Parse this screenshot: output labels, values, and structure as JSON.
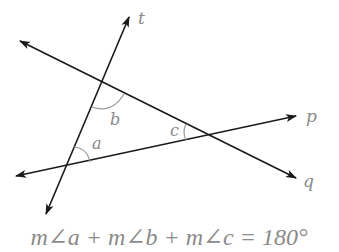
{
  "diagram": {
    "lines": [
      {
        "name": "t",
        "label": "t",
        "from": [
          46,
          214
        ],
        "to": [
          129,
          17
        ]
      },
      {
        "name": "q",
        "label": "q",
        "from": [
          20,
          41
        ],
        "to": [
          296,
          178
        ]
      },
      {
        "name": "p",
        "label": "p",
        "from": [
          16,
          176
        ],
        "to": [
          296,
          116
        ]
      }
    ],
    "angles": [
      {
        "name": "a",
        "label": "a"
      },
      {
        "name": "b",
        "label": "b"
      },
      {
        "name": "c",
        "label": "c"
      }
    ],
    "line_labels": {
      "t": "t",
      "p": "p",
      "q": "q"
    },
    "angle_labels": {
      "a": "a",
      "b": "b",
      "c": "c"
    },
    "equation": "m∠a + m∠b + m∠c = 180°",
    "colors": {
      "line": "#1a1a1a",
      "label": "#8a8a8a",
      "arc": "#9a9a9a"
    }
  }
}
